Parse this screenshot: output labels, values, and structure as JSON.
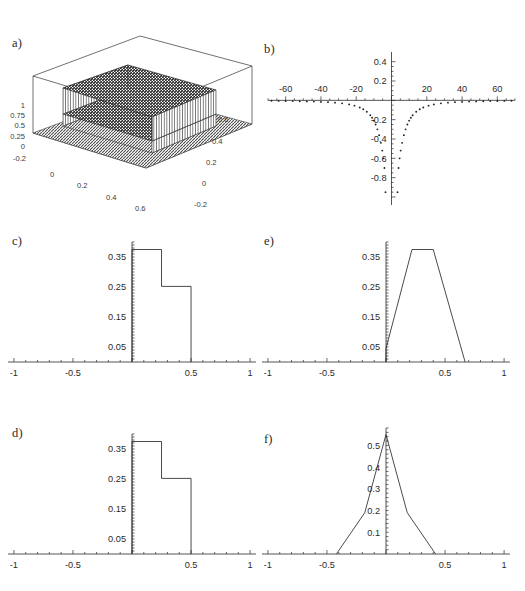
{
  "figure": {
    "background_color": "#ffffff",
    "line_color": "#2a2a2a",
    "panel_labels": {
      "a": "a)",
      "b": "b)",
      "c": "c)",
      "d": "d)",
      "e": "e)",
      "f": "f)"
    }
  },
  "chart_data": [
    {
      "id": "a",
      "type": "surface",
      "title": "a)",
      "xlabel": "",
      "ylabel": "",
      "zlabel": "",
      "grid": false,
      "legend": "none",
      "x_ticks": [
        "0",
        "0.2",
        "0.4",
        "0.6"
      ],
      "y_ticks": [
        "0.6",
        "0.4",
        "0.2",
        "0",
        "-0.2"
      ],
      "z_ticks": [
        "1",
        "0.75",
        "0.5",
        "0.25",
        "0",
        "-0.2"
      ],
      "xlim": [
        -0.2,
        0.7
      ],
      "ylim": [
        -0.2,
        0.7
      ],
      "zlim": [
        -0.2,
        1.0
      ],
      "description": "3D mesh surface of a piecewise-constant (box/step) two-dimensional function: a flat base plateau at 0 with a raised rectangular block of height ~0.5 and a taller block of height ~1 on top, drawn as a dark cross-hatched wireframe mesh inside an open box frame.",
      "plateaus": [
        {
          "name": "base",
          "height": 0.0
        },
        {
          "name": "lower-step",
          "height": 0.5
        },
        {
          "name": "upper-step",
          "height": 1.0
        }
      ]
    },
    {
      "id": "b",
      "type": "scatter",
      "title": "b)",
      "xlabel": "",
      "ylabel": "",
      "grid": false,
      "legend": "none",
      "x_ticks": [
        -60,
        -40,
        -20,
        20,
        40,
        60
      ],
      "y_ticks": [
        0.4,
        0.2,
        -0.2,
        -0.4,
        -0.6,
        -0.8
      ],
      "xlim": [
        -70,
        70
      ],
      "ylim": [
        -1.0,
        0.5
      ],
      "description": "Symmetric point plot of a function that is near zero for large |x| and dives steeply to large negative values as x approaches 0 from either side; points become sparse and fall off the bottom of the frame near the origin.",
      "x": [
        -68,
        -64,
        -60,
        -56,
        -52,
        -48,
        -44,
        -40,
        -36,
        -32,
        -28,
        -24,
        -21,
        -18,
        -16,
        -14,
        -12,
        -11,
        -10,
        -9,
        -8,
        -7,
        -6,
        -5.2,
        -4.6,
        -4.0,
        4.0,
        4.6,
        5.2,
        6,
        7,
        8,
        9,
        10,
        11,
        12,
        14,
        16,
        18,
        21,
        24,
        28,
        32,
        36,
        40,
        44,
        48,
        52,
        56,
        60,
        64,
        68
      ],
      "y": [
        -0.005,
        -0.006,
        -0.007,
        -0.008,
        -0.009,
        -0.011,
        -0.013,
        -0.016,
        -0.019,
        -0.024,
        -0.031,
        -0.042,
        -0.055,
        -0.074,
        -0.092,
        -0.118,
        -0.155,
        -0.18,
        -0.21,
        -0.25,
        -0.3,
        -0.36,
        -0.44,
        -0.52,
        -0.6,
        -0.7,
        -0.7,
        -0.6,
        -0.52,
        -0.44,
        -0.36,
        -0.3,
        -0.25,
        -0.21,
        -0.18,
        -0.155,
        -0.118,
        -0.092,
        -0.074,
        -0.055,
        -0.042,
        -0.031,
        -0.024,
        -0.019,
        -0.016,
        -0.013,
        -0.011,
        -0.009,
        -0.008,
        -0.007,
        -0.006,
        -0.005
      ]
    },
    {
      "id": "c",
      "type": "line",
      "title": "c)",
      "xlabel": "",
      "ylabel": "",
      "grid": false,
      "legend": "none",
      "x_ticks": [
        -1,
        -0.5,
        0.5,
        1
      ],
      "y_ticks": [
        0.35,
        0.25,
        0.15,
        0.05
      ],
      "xlim": [
        -1.05,
        1.05
      ],
      "ylim": [
        0,
        0.4
      ],
      "description": "Two-level step (staircase) density: constant ~0.375 on [0, 0.25] then constant ~0.25 on [0.25, 0.5], zero elsewhere.",
      "steps": [
        {
          "x_start": 0.0,
          "x_end": 0.25,
          "height": 0.375
        },
        {
          "x_start": 0.25,
          "x_end": 0.5,
          "height": 0.252
        }
      ]
    },
    {
      "id": "d",
      "type": "line",
      "title": "d)",
      "xlabel": "",
      "ylabel": "",
      "grid": false,
      "legend": "none",
      "x_ticks": [
        -1,
        -0.5,
        0.5,
        1
      ],
      "y_ticks": [
        0.35,
        0.25,
        0.15,
        0.05
      ],
      "xlim": [
        -1.05,
        1.05
      ],
      "ylim": [
        0,
        0.4
      ],
      "description": "Two-level step (staircase) density identical in form to panel c): constant ~0.375 on [0, 0.25] then constant ~0.25 on [0.25, 0.5], zero elsewhere.",
      "steps": [
        {
          "x_start": 0.0,
          "x_end": 0.25,
          "height": 0.375
        },
        {
          "x_start": 0.25,
          "x_end": 0.5,
          "height": 0.252
        }
      ]
    },
    {
      "id": "e",
      "type": "line",
      "title": "e)",
      "xlabel": "",
      "ylabel": "",
      "grid": false,
      "legend": "none",
      "x_ticks": [
        -1,
        -0.5,
        0.5,
        1
      ],
      "y_ticks": [
        0.35,
        0.25,
        0.15,
        0.05
      ],
      "xlim": [
        -1.05,
        1.05
      ],
      "ylim": [
        0,
        0.4
      ],
      "description": "Trapezoidal density: rises steeply from 0 at x=0 up to a flat plateau of ~0.375 between x=0.22 and x=0.40, then falls linearly back to 0 at x=0.67.",
      "vertices": [
        {
          "x": 0.0,
          "y": 0.0
        },
        {
          "x": 0.0,
          "y": 0.045
        },
        {
          "x": 0.22,
          "y": 0.375
        },
        {
          "x": 0.4,
          "y": 0.375
        },
        {
          "x": 0.67,
          "y": 0.0
        }
      ]
    },
    {
      "id": "f",
      "type": "line",
      "title": "f)",
      "xlabel": "",
      "ylabel": "",
      "grid": false,
      "legend": "none",
      "x_ticks": [
        -1,
        -0.5,
        0.5,
        1
      ],
      "y_ticks": [
        0.5,
        0.4,
        0.3,
        0.2,
        0.1
      ],
      "xlim": [
        -1.05,
        1.05
      ],
      "ylim": [
        0,
        0.58
      ],
      "description": "Symmetric peaked (tent-like) density centred at x=0 with maximum ~0.55, piecewise-linear flanks with a slope change near x = +/-0.18 at height ~0.19, reaching zero at x = +/-0.42.",
      "vertices": [
        {
          "x": -0.42,
          "y": 0.0
        },
        {
          "x": -0.18,
          "y": 0.19
        },
        {
          "x": 0.0,
          "y": 0.55
        },
        {
          "x": 0.18,
          "y": 0.19
        },
        {
          "x": 0.42,
          "y": 0.0
        }
      ]
    }
  ]
}
